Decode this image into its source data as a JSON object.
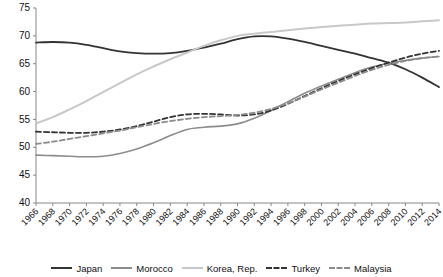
{
  "chart_data": {
    "type": "line",
    "title": "",
    "xlabel": "",
    "ylabel": "",
    "ylim": [
      40,
      75
    ],
    "ytick_values": [
      40,
      45,
      50,
      55,
      60,
      65,
      70,
      75
    ],
    "grid": false,
    "legend_position": "bottom",
    "x": [
      1966,
      1968,
      1970,
      1972,
      1974,
      1976,
      1978,
      1980,
      1982,
      1984,
      1986,
      1988,
      1990,
      1992,
      1994,
      1996,
      1998,
      2000,
      2002,
      2004,
      2006,
      2008,
      2010,
      2012,
      2014
    ],
    "xtick_labels": [
      "1966",
      "1968",
      "1970",
      "1972",
      "1974",
      "1976",
      "1978",
      "1980",
      "1982",
      "1984",
      "1986",
      "1988",
      "1990",
      "1992",
      "1994",
      "1996",
      "1998",
      "2000",
      "2002",
      "2004",
      "2006",
      "2008",
      "2010",
      "2012",
      "2014"
    ],
    "series": [
      {
        "name": "Japan",
        "color": "#333333",
        "style": "solid",
        "width": 1.8,
        "values": [
          68.8,
          68.9,
          68.8,
          68.4,
          67.8,
          67.2,
          66.9,
          66.8,
          66.9,
          67.3,
          67.9,
          68.6,
          69.4,
          69.9,
          69.9,
          69.5,
          68.9,
          68.2,
          67.5,
          66.8,
          66.0,
          65.2,
          64.0,
          62.5,
          60.8
        ]
      },
      {
        "name": "Morocco",
        "color": "#8c8c8c",
        "style": "solid",
        "width": 1.6,
        "values": [
          48.6,
          48.5,
          48.4,
          48.3,
          48.4,
          48.9,
          49.7,
          50.8,
          52.1,
          53.2,
          53.6,
          53.8,
          54.2,
          55.2,
          56.6,
          58.2,
          59.7,
          61.0,
          62.2,
          63.4,
          64.4,
          65.1,
          65.6,
          66.0,
          66.3
        ]
      },
      {
        "name": "Korea, Rep.",
        "color": "#c8c8c8",
        "style": "solid",
        "width": 2.0,
        "values": [
          54.3,
          55.4,
          56.8,
          58.3,
          59.9,
          61.5,
          63.1,
          64.5,
          65.8,
          67.0,
          68.2,
          69.2,
          70.0,
          70.4,
          70.7,
          71.0,
          71.3,
          71.6,
          71.8,
          72.0,
          72.2,
          72.3,
          72.4,
          72.6,
          72.8
        ]
      },
      {
        "name": "Turkey",
        "color": "#333333",
        "style": "dashed",
        "width": 1.8,
        "values": [
          52.8,
          52.7,
          52.6,
          52.6,
          52.8,
          53.2,
          53.8,
          54.6,
          55.4,
          55.9,
          56.0,
          55.9,
          55.7,
          55.9,
          56.6,
          57.8,
          59.2,
          60.6,
          61.9,
          63.1,
          64.2,
          65.2,
          66.1,
          66.8,
          67.3
        ]
      },
      {
        "name": "Malaysia",
        "color": "#8c8c8c",
        "style": "dashed",
        "width": 1.8,
        "values": [
          50.6,
          51.0,
          51.5,
          52.0,
          52.5,
          53.0,
          53.6,
          54.2,
          54.7,
          55.1,
          55.4,
          55.6,
          55.8,
          56.2,
          56.9,
          57.9,
          59.1,
          60.4,
          61.6,
          62.8,
          63.9,
          64.8,
          65.5,
          66.0,
          66.3
        ]
      }
    ]
  },
  "legend": {
    "items": [
      {
        "label": "Japan",
        "color": "#333333",
        "style": "solid"
      },
      {
        "label": "Morocco",
        "color": "#8c8c8c",
        "style": "solid"
      },
      {
        "label": "Korea, Rep.",
        "color": "#c8c8c8",
        "style": "solid"
      },
      {
        "label": "Turkey",
        "color": "#333333",
        "style": "dashed"
      },
      {
        "label": "Malaysia",
        "color": "#8c8c8c",
        "style": "dashed"
      }
    ]
  }
}
